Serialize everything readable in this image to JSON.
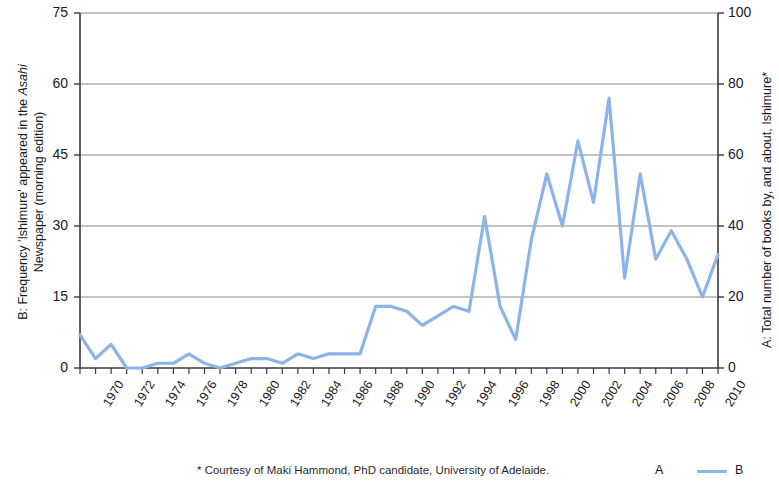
{
  "chart_data": {
    "type": "line",
    "title": "",
    "xlabel": "",
    "ylabel": "B: Frequency 'Ishimure' appeared in the Asahi Newspaper (morning edition)",
    "y2label": "A: Total number of books by, and about, Ishimure*",
    "xlim": [
      1970,
      2011
    ],
    "ylim": [
      0,
      75
    ],
    "y2lim": [
      0,
      100
    ],
    "grid": true,
    "legend_position": "bottom-right",
    "x": [
      1970,
      1971,
      1972,
      1973,
      1974,
      1975,
      1976,
      1977,
      1978,
      1979,
      1980,
      1981,
      1982,
      1983,
      1984,
      1985,
      1986,
      1987,
      1988,
      1989,
      1990,
      1991,
      1992,
      1993,
      1994,
      1995,
      1996,
      1997,
      1998,
      1999,
      2000,
      2001,
      2002,
      2003,
      2004,
      2005,
      2006,
      2007,
      2008,
      2009,
      2010,
      2011
    ],
    "series": [
      {
        "name": "B",
        "color": "#8CB4E8",
        "values": [
          7,
          2,
          5,
          0,
          0,
          1,
          1,
          3,
          1,
          0,
          1,
          2,
          2,
          1,
          3,
          2,
          3,
          3,
          3,
          13,
          13,
          12,
          9,
          11,
          13,
          12,
          32,
          13,
          6,
          27,
          41,
          30,
          48,
          35,
          57,
          19,
          41,
          23,
          29,
          23,
          15,
          24
        ]
      }
    ],
    "y_ticks_left": [
      "0",
      "15",
      "30",
      "45",
      "60",
      "75"
    ],
    "y_ticks_right": [
      "0",
      "20",
      "40",
      "60",
      "80",
      "100"
    ],
    "x_ticks": [
      "1970",
      "1972",
      "1974",
      "1976",
      "1978",
      "1980",
      "1982",
      "1984",
      "1986",
      "1988",
      "1990",
      "1992",
      "1994",
      "1996",
      "1998",
      "2000",
      "2002",
      "2004",
      "2006",
      "2008",
      "2010"
    ]
  },
  "axes": {
    "left_title_part1": "B: Frequency 'Ishimure' appeared  in the ",
    "left_title_italic": "Asahi",
    "left_title_part2": "Newspaper (morning edition)",
    "right_title": "A: Total number of books by, and about, Ishimure*"
  },
  "footnote": {
    "text": "* Courtesy of Maki Hammond, PhD candidate, University of Adelaide."
  },
  "legend": {
    "series_a_label": "A",
    "series_b_label": "B"
  }
}
